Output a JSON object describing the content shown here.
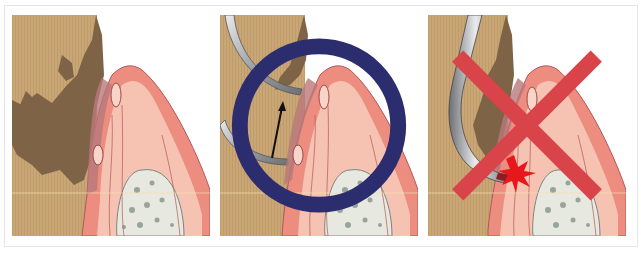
{
  "figure": {
    "panels": [
      {
        "id": "panel-1",
        "label": "",
        "content": "Tooth root with subgingival calculus deposits, gingival tissue and alveolar bone"
      },
      {
        "id": "panel-2",
        "label": "",
        "content": "Curette positioned below calculus, arrow indicating upward stroke",
        "mark": "○",
        "mark_meaning": "correct"
      },
      {
        "id": "panel-3",
        "label": "",
        "content": "Instrument tip penetrating gingival tissue causing injury",
        "mark": "×",
        "mark_meaning": "incorrect"
      }
    ],
    "colors": {
      "tooth": "#c9a675",
      "calculus": "#7e6347",
      "gingiva_outer": "#ec8d80",
      "gingiva_inner": "#f6c2b1",
      "bone": "#e7e8df",
      "bone_spots": "#9aa39a",
      "pocket": "#b9787b",
      "instrument": "#a9abae",
      "injury": "#e8171b",
      "circle_mark": "#2b2d6e",
      "cross_mark": "#d9444a"
    }
  }
}
